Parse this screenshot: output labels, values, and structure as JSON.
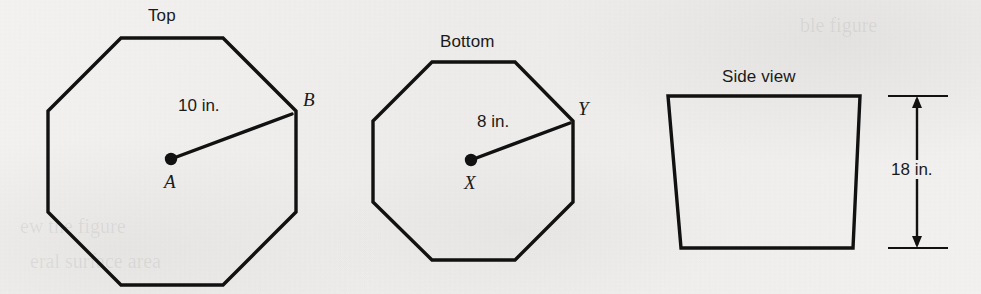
{
  "figure": {
    "background_color": "#f2f1ef",
    "stroke_color": "#111111",
    "views": [
      {
        "id": "top-view",
        "title": "Top",
        "shape": "regular-octagon",
        "center_label": "A",
        "vertex_label": "B",
        "radius_label": "10 in.",
        "radius_value": 10,
        "radius_unit": "in."
      },
      {
        "id": "bottom-view",
        "title": "Bottom",
        "shape": "regular-octagon",
        "center_label": "X",
        "vertex_label": "Y",
        "radius_label": "8 in.",
        "radius_value": 8,
        "radius_unit": "in."
      },
      {
        "id": "side-view",
        "title": "Side view",
        "shape": "trapezoid",
        "dimension_label": "18 in.",
        "dimension_value": 18,
        "dimension_unit": "in."
      }
    ]
  }
}
